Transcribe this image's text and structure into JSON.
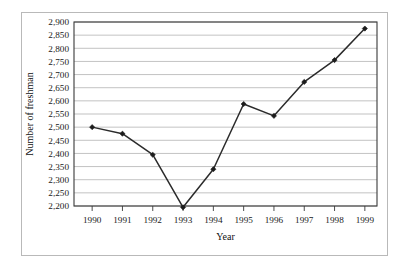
{
  "chart_data": {
    "type": "line",
    "title": "",
    "xlabel": "Year",
    "ylabel": "Number of freshman",
    "categories": [
      "1990",
      "1991",
      "1992",
      "1993",
      "1994",
      "1995",
      "1996",
      "1997",
      "1998",
      "1999"
    ],
    "x": [
      1990,
      1991,
      1992,
      1993,
      1994,
      1995,
      1996,
      1997,
      1998,
      1999
    ],
    "values": [
      2500,
      2475,
      2395,
      2195,
      2340,
      2588,
      2543,
      2672,
      2755,
      2875
    ],
    "series": [
      {
        "name": "Number of freshman",
        "values": [
          2500,
          2475,
          2395,
          2195,
          2340,
          2588,
          2543,
          2672,
          2755,
          2875
        ]
      }
    ],
    "ylim": [
      2200,
      2900
    ],
    "ytick_step": 50,
    "ytick_labels": [
      "2,200",
      "2,250",
      "2,300",
      "2,350",
      "2,400",
      "2,450",
      "2,500",
      "2,550",
      "2,600",
      "2,650",
      "2,700",
      "2,750",
      "2,800",
      "2,850",
      "2,900"
    ],
    "ytick_values": [
      2200,
      2250,
      2300,
      2350,
      2400,
      2450,
      2500,
      2550,
      2600,
      2650,
      2700,
      2750,
      2800,
      2850,
      2900
    ],
    "xtick_labels": [
      "1990",
      "1991",
      "1992",
      "1993",
      "1994",
      "1995",
      "1996",
      "1997",
      "1998",
      "1999"
    ],
    "grid": "horizontal",
    "legend": "none",
    "marker": "filled-diamond",
    "line_color": "#2b2b2b",
    "grid_color": "#a8a8a8",
    "frame_color": "#b9b9b9"
  }
}
